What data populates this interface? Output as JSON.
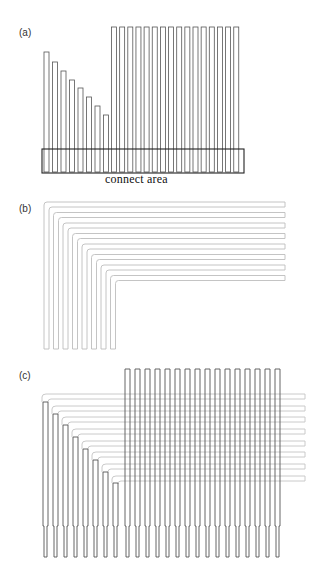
{
  "panels": [
    {
      "id": "a",
      "label": "(a)"
    },
    {
      "id": "b",
      "label": "(b)"
    },
    {
      "id": "c",
      "label": "(c)"
    }
  ],
  "panel_a": {
    "caption": "connect area",
    "stroke": "#555555",
    "bar_width": 5,
    "stair_bars": {
      "x": [
        44,
        52.5,
        61,
        69.5,
        78,
        86.5,
        95,
        103.5
      ],
      "top": [
        52,
        62,
        71,
        80,
        88,
        97,
        106,
        115
      ],
      "bottom": 172
    },
    "tall_bars": {
      "count": 16,
      "x_start": 111.5,
      "pitch": 8.15,
      "top": 27,
      "bottom": 172
    },
    "connect_area": {
      "x": 42,
      "y": 149,
      "w": 202,
      "h": 24
    }
  },
  "panel_b": {
    "stroke": "#bdbdbd",
    "trace_count": 8,
    "leg_x": [
      44,
      53.5,
      63,
      72.5,
      82,
      91.5,
      101,
      110.5
    ],
    "run_y": [
      202,
      212.5,
      223,
      233.5,
      244,
      254.5,
      265,
      275.5
    ],
    "right_x": 285,
    "bottom_y": 349,
    "trace_width": 5
  },
  "panel_c": {
    "stroke_bar": "#555555",
    "stroke_trace": "#c4c4c4",
    "bar_width": 5,
    "tall_bars": {
      "count": 16,
      "x_start": 125,
      "pitch": 10,
      "top": 369,
      "neck_y": 526,
      "bottom": 557
    },
    "stair_bars": {
      "x": [
        43,
        53,
        63,
        73,
        83,
        93,
        103,
        113
      ],
      "top": [
        402,
        414,
        425,
        437,
        449,
        460,
        472,
        483
      ],
      "neck_y": 526,
      "bottom": 557
    },
    "traces": {
      "run_y": [
        394,
        406,
        417,
        429,
        441,
        452,
        464,
        476
      ],
      "right_x": 305,
      "trace_width": 5
    }
  }
}
